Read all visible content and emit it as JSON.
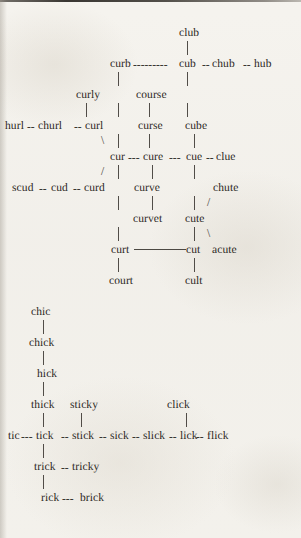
{
  "document": {
    "type": "word-network-diagram",
    "title": "Word association network",
    "background_color": "#f3f1ec",
    "text_color": "#2b2723",
    "rule_color": "#3a3631"
  },
  "clusters": [
    {
      "id": "cur-cluster",
      "root": "club"
    },
    {
      "id": "ick-cluster",
      "root": "chic"
    }
  ],
  "rows": [
    {
      "id": "r-club",
      "y": 27,
      "text": "club"
    },
    {
      "id": "r-curb",
      "y": 58,
      "text": "curb---------cub--chub--hub"
    },
    {
      "id": "r-curly",
      "y": 89,
      "text": "curly  |  course   |"
    },
    {
      "id": "r-hurl",
      "y": 120,
      "text": "hurl--churl--curl  |  curse    cube"
    },
    {
      "id": "r-cur",
      "y": 151,
      "text": "cur---cure---cue--clue"
    },
    {
      "id": "r-scud",
      "y": 182,
      "text": "scud--cud--curd  |  curve    |   chute"
    },
    {
      "id": "r-curvet",
      "y": 213,
      "text": "|   curvet   cute"
    },
    {
      "id": "r-curt",
      "y": 244,
      "text": "curt--------cut  acute"
    },
    {
      "id": "r-court",
      "y": 275,
      "text": "court          cult"
    },
    {
      "id": "r-chic",
      "y": 306,
      "text": "chic"
    },
    {
      "id": "r-chick",
      "y": 337,
      "text": "chick"
    },
    {
      "id": "r-hick",
      "y": 368,
      "text": "hick"
    },
    {
      "id": "r-thick",
      "y": 399,
      "text": "thick  sticky          click"
    },
    {
      "id": "r-tic",
      "y": 430,
      "text": "tic---tick--stick--sick--slick--lick--flick"
    },
    {
      "id": "r-trick",
      "y": 461,
      "text": "trick--tricky"
    },
    {
      "id": "r-rick",
      "y": 492,
      "text": "rick---brick"
    }
  ],
  "words": [
    {
      "id": "w-club",
      "label": "club",
      "x": 179,
      "y": 27
    },
    {
      "id": "w-curb",
      "label": "curb",
      "x": 110,
      "y": 58
    },
    {
      "id": "w-cub",
      "label": "cub",
      "x": 179,
      "y": 58
    },
    {
      "id": "w-chub",
      "label": "chub",
      "x": 212,
      "y": 58
    },
    {
      "id": "w-hub",
      "label": "hub",
      "x": 254,
      "y": 58
    },
    {
      "id": "w-curly",
      "label": "curly",
      "x": 76,
      "y": 89
    },
    {
      "id": "w-course",
      "label": "course",
      "x": 136,
      "y": 89
    },
    {
      "id": "w-hurl",
      "label": "hurl",
      "x": 5,
      "y": 120
    },
    {
      "id": "w-churl",
      "label": "churl",
      "x": 38,
      "y": 120
    },
    {
      "id": "w-curl",
      "label": "curl",
      "x": 85,
      "y": 120
    },
    {
      "id": "w-curse",
      "label": "curse",
      "x": 138,
      "y": 120
    },
    {
      "id": "w-cube",
      "label": "cube",
      "x": 185,
      "y": 120
    },
    {
      "id": "w-cur",
      "label": "cur",
      "x": 110,
      "y": 151
    },
    {
      "id": "w-cure",
      "label": "cure",
      "x": 143,
      "y": 151
    },
    {
      "id": "w-cue",
      "label": "cue",
      "x": 186,
      "y": 151
    },
    {
      "id": "w-clue",
      "label": "clue",
      "x": 216,
      "y": 151
    },
    {
      "id": "w-scud",
      "label": "scud",
      "x": 12,
      "y": 182
    },
    {
      "id": "w-cud",
      "label": "cud",
      "x": 51,
      "y": 182
    },
    {
      "id": "w-curd",
      "label": "curd",
      "x": 84,
      "y": 182
    },
    {
      "id": "w-curve",
      "label": "curve",
      "x": 134,
      "y": 182
    },
    {
      "id": "w-chute",
      "label": "chute",
      "x": 213,
      "y": 182
    },
    {
      "id": "w-curvet",
      "label": "curvet",
      "x": 133,
      "y": 213
    },
    {
      "id": "w-cute",
      "label": "cute",
      "x": 185,
      "y": 213
    },
    {
      "id": "w-curt",
      "label": "curt",
      "x": 111,
      "y": 244
    },
    {
      "id": "w-cut",
      "label": "cut",
      "x": 186,
      "y": 244
    },
    {
      "id": "w-acute",
      "label": "acute",
      "x": 212,
      "y": 244
    },
    {
      "id": "w-court",
      "label": "court",
      "x": 109,
      "y": 275
    },
    {
      "id": "w-cult",
      "label": "cult",
      "x": 185,
      "y": 275
    },
    {
      "id": "w-chic",
      "label": "chic",
      "x": 31,
      "y": 306
    },
    {
      "id": "w-chick",
      "label": "chick",
      "x": 29,
      "y": 337
    },
    {
      "id": "w-hick",
      "label": "hick",
      "x": 37,
      "y": 368
    },
    {
      "id": "w-thick",
      "label": "thick",
      "x": 31,
      "y": 399
    },
    {
      "id": "w-sticky",
      "label": "sticky",
      "x": 70,
      "y": 399
    },
    {
      "id": "w-click",
      "label": "click",
      "x": 167,
      "y": 399
    },
    {
      "id": "w-tic",
      "label": "tic",
      "x": 8,
      "y": 430
    },
    {
      "id": "w-tick",
      "label": "tick",
      "x": 36,
      "y": 430
    },
    {
      "id": "w-stick",
      "label": "stick",
      "x": 72,
      "y": 430
    },
    {
      "id": "w-sick",
      "label": "sick",
      "x": 110,
      "y": 430
    },
    {
      "id": "w-slick",
      "label": "slick",
      "x": 143,
      "y": 430
    },
    {
      "id": "w-lick",
      "label": "lick",
      "x": 180,
      "y": 430
    },
    {
      "id": "w-flick",
      "label": "flick",
      "x": 207,
      "y": 430
    },
    {
      "id": "w-trick",
      "label": "trick",
      "x": 34,
      "y": 461
    },
    {
      "id": "w-tricky",
      "label": "tricky",
      "x": 72,
      "y": 461
    },
    {
      "id": "w-rick",
      "label": "rick",
      "x": 41,
      "y": 492
    },
    {
      "id": "w-brick",
      "label": "brick",
      "x": 80,
      "y": 492
    }
  ],
  "h_dashes": [
    {
      "id": "h-curb-cub",
      "label": "---------",
      "x": 133,
      "y": 58
    },
    {
      "id": "h-cub-chub",
      "label": "--",
      "x": 202,
      "y": 58
    },
    {
      "id": "h-chub-hub",
      "label": "--",
      "x": 243,
      "y": 58
    },
    {
      "id": "h-hurl-churl",
      "label": "--",
      "x": 27,
      "y": 120
    },
    {
      "id": "h-churl-curl",
      "label": "--",
      "x": 74,
      "y": 120
    },
    {
      "id": "h-cur-cure",
      "label": "---",
      "x": 128,
      "y": 151
    },
    {
      "id": "h-cure-cue",
      "label": "---",
      "x": 169,
      "y": 151
    },
    {
      "id": "h-cue-clue",
      "label": "--",
      "x": 206,
      "y": 151
    },
    {
      "id": "h-scud-cud",
      "label": "--",
      "x": 39,
      "y": 182
    },
    {
      "id": "h-cud-curd",
      "label": "--",
      "x": 73,
      "y": 182
    },
    {
      "id": "h-tic-tick",
      "label": "---",
      "x": 21,
      "y": 430
    },
    {
      "id": "h-tick-stick",
      "label": "--",
      "x": 61,
      "y": 430
    },
    {
      "id": "h-stick-sick",
      "label": "--",
      "x": 99,
      "y": 430
    },
    {
      "id": "h-sick-slick",
      "label": "--",
      "x": 132,
      "y": 430
    },
    {
      "id": "h-slick-lick",
      "label": "--",
      "x": 169,
      "y": 430
    },
    {
      "id": "h-lick-flick",
      "label": "--",
      "x": 196,
      "y": 430
    },
    {
      "id": "h-trick-tricky",
      "label": "--",
      "x": 61,
      "y": 461
    },
    {
      "id": "h-rick-brick",
      "label": "---",
      "x": 62,
      "y": 492
    }
  ],
  "v_links": [
    {
      "id": "v-club-curb",
      "x": 187,
      "y": 41,
      "h": 14
    },
    {
      "id": "v-curb-curly",
      "x": 118,
      "y": 72,
      "h": 14
    },
    {
      "id": "v-cub-cube1",
      "x": 187,
      "y": 72,
      "h": 14
    },
    {
      "id": "v-curly-curl",
      "x": 86,
      "y": 103,
      "h": 14
    },
    {
      "id": "v-curbstem2",
      "x": 118,
      "y": 103,
      "h": 14
    },
    {
      "id": "v-course-curse",
      "x": 149,
      "y": 103,
      "h": 14
    },
    {
      "id": "v-cub-cube2",
      "x": 187,
      "y": 103,
      "h": 14
    },
    {
      "id": "v-curbstem3",
      "x": 118,
      "y": 134,
      "h": 14
    },
    {
      "id": "v-curse-cure",
      "x": 149,
      "y": 134,
      "h": 14
    },
    {
      "id": "v-cube-cue",
      "x": 194,
      "y": 134,
      "h": 14
    },
    {
      "id": "v-cur-stem1",
      "x": 118,
      "y": 165,
      "h": 14
    },
    {
      "id": "v-cure-curve",
      "x": 152,
      "y": 165,
      "h": 14
    },
    {
      "id": "v-cue-cute1",
      "x": 194,
      "y": 165,
      "h": 14
    },
    {
      "id": "v-cur-stem2",
      "x": 118,
      "y": 196,
      "h": 14
    },
    {
      "id": "v-curve-curvet",
      "x": 152,
      "y": 196,
      "h": 14
    },
    {
      "id": "v-cue-cute2",
      "x": 194,
      "y": 196,
      "h": 14
    },
    {
      "id": "v-cur-stem3",
      "x": 118,
      "y": 227,
      "h": 14
    },
    {
      "id": "v-cute-cut",
      "x": 194,
      "y": 227,
      "h": 14
    },
    {
      "id": "v-curt-court",
      "x": 118,
      "y": 258,
      "h": 14
    },
    {
      "id": "v-cut-cult",
      "x": 194,
      "y": 258,
      "h": 14
    },
    {
      "id": "v-chic-chick",
      "x": 43,
      "y": 320,
      "h": 14
    },
    {
      "id": "v-chick-hick",
      "x": 43,
      "y": 351,
      "h": 14
    },
    {
      "id": "v-hick-thick",
      "x": 43,
      "y": 382,
      "h": 14
    },
    {
      "id": "v-thick-tick",
      "x": 43,
      "y": 413,
      "h": 14
    },
    {
      "id": "v-sticky-stick",
      "x": 81,
      "y": 413,
      "h": 14
    },
    {
      "id": "v-click-lick",
      "x": 186,
      "y": 413,
      "h": 14
    },
    {
      "id": "v-tick-trick",
      "x": 43,
      "y": 444,
      "h": 14
    },
    {
      "id": "v-trick-rick",
      "x": 43,
      "y": 475,
      "h": 14
    }
  ],
  "h_rules": [
    {
      "id": "rule-curt-cut",
      "x": 134,
      "y": 249,
      "w": 52
    }
  ],
  "d_links": [
    {
      "id": "d-curl-cur",
      "glyph": "\\",
      "x": 101,
      "y": 134
    },
    {
      "id": "d-cur-curd",
      "glyph": "/",
      "x": 101,
      "y": 165
    },
    {
      "id": "d-chute-cute",
      "glyph": "/",
      "x": 207,
      "y": 196
    },
    {
      "id": "d-cute-acute",
      "glyph": "\\",
      "x": 207,
      "y": 227
    }
  ]
}
